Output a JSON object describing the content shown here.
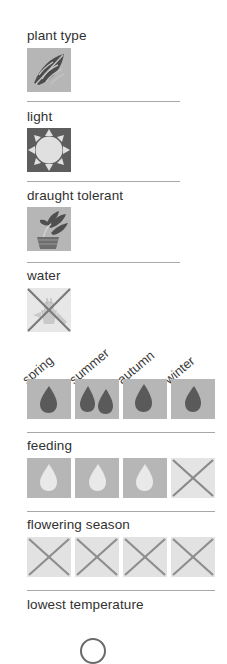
{
  "page": {
    "background": "#ffffff",
    "tile_color": "#b6b6b6",
    "tile_dark_color": "#5d5d5d",
    "tile_faded_color": "#e2e2e2",
    "glyph_dark_color": "#5a5a5a",
    "glyph_light_color": "#e6e6e6",
    "divider_color": "#a8a8a8",
    "cross_color": "#7a7a7a"
  },
  "seasons": [
    {
      "label": "spring"
    },
    {
      "label": "summer"
    },
    {
      "label": "autumn"
    },
    {
      "label": "winter"
    }
  ],
  "sections": [
    {
      "key": "plant_type",
      "label": "plant type",
      "icon": "leaf-icon",
      "value": "leaf",
      "crossed": false
    },
    {
      "key": "light",
      "label": "light",
      "icon": "sun-icon",
      "value": "full sun",
      "crossed": false
    },
    {
      "key": "draught_tolerant",
      "label": "draught tolerant",
      "icon": "potted-plant-icon",
      "value": "yes",
      "crossed": false
    },
    {
      "key": "water",
      "label": "water",
      "icon": "watering-can-icon",
      "value": "none",
      "crossed": true
    }
  ],
  "season_rows": [
    {
      "key": "watering",
      "label": "",
      "show_label": false,
      "cells": [
        {
          "season": "spring",
          "drops": 1,
          "drop_style": "dark",
          "crossed": false
        },
        {
          "season": "summer",
          "drops": 2,
          "drop_style": "dark",
          "crossed": false
        },
        {
          "season": "autumn",
          "drops": 1,
          "drop_style": "dark",
          "crossed": false
        },
        {
          "season": "winter",
          "drops": 1,
          "drop_style": "dark",
          "crossed": false
        }
      ]
    },
    {
      "key": "feeding",
      "label": "feeding",
      "show_label": true,
      "cells": [
        {
          "season": "spring",
          "drops": 1,
          "drop_style": "light",
          "crossed": false
        },
        {
          "season": "summer",
          "drops": 1,
          "drop_style": "light",
          "crossed": false
        },
        {
          "season": "autumn",
          "drops": 1,
          "drop_style": "light",
          "crossed": false
        },
        {
          "season": "winter",
          "drops": 0,
          "drop_style": "light",
          "crossed": true
        }
      ]
    },
    {
      "key": "flowering_season",
      "label": "flowering season",
      "show_label": true,
      "cells": [
        {
          "season": "spring",
          "drops": 0,
          "drop_style": "faded",
          "crossed": true
        },
        {
          "season": "summer",
          "drops": 0,
          "drop_style": "faded",
          "crossed": true
        },
        {
          "season": "autumn",
          "drops": 0,
          "drop_style": "faded",
          "crossed": true
        },
        {
          "season": "winter",
          "drops": 0,
          "drop_style": "faded",
          "crossed": true
        }
      ]
    }
  ],
  "footer": {
    "label": "lowest temperature",
    "value": ""
  }
}
